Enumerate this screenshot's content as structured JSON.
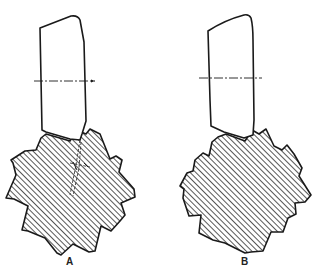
{
  "figure": {
    "panels": [
      {
        "id": "A",
        "label": "A",
        "tool": "cutting tool block with chamfered top and angled cutting edge",
        "workpiece": "serrated hatched gear-like workpiece with 11 teeth",
        "annotations": "dashed crack/fracture lines with small cross marker inside workpiece near tool contact"
      },
      {
        "id": "B",
        "label": "B",
        "tool": "cutting tool block with rounded top corner",
        "workpiece": "serrated hatched gear-like workpiece with 12 teeth",
        "annotations": "none"
      }
    ],
    "colors": {
      "outline": "#1a1a1a",
      "hatch": "#333333",
      "background": "#ffffff"
    }
  }
}
